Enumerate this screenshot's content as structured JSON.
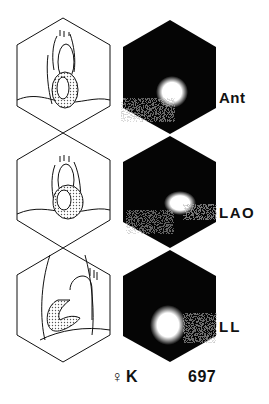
{
  "figure": {
    "rows": [
      {
        "view": "Ant",
        "diagram": "schematic-heart-anterior",
        "scan": "scintigram-anterior"
      },
      {
        "view": "LAO",
        "diagram": "schematic-heart-lao",
        "scan": "scintigram-lao"
      },
      {
        "view": "LL",
        "diagram": "schematic-heart-left-lateral",
        "scan": "scintigram-left-lateral"
      }
    ],
    "footer": {
      "sex_symbol": "♀",
      "patient_initial": "K",
      "case_number": "697"
    }
  }
}
